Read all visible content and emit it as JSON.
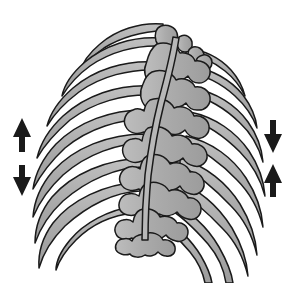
{
  "figure": {
    "title": "Rib cage and thoracic spine, posterior view",
    "view": "posterior",
    "style": "line-drawing",
    "background_color": "#ffffff"
  },
  "palette": {
    "bone_fill": "#ababab",
    "bone_fill_light": "#c4c4c4",
    "bone_fill_dark": "#9a9a9a",
    "outline": "#1a1a1a",
    "arrow_fill": "#1a1a1a",
    "background": "#ffffff"
  },
  "structures": {
    "spine": {
      "name": "thoracic-vertebral-column",
      "label": "Thoracic vertebral column",
      "vertebra_count": 9,
      "orientation": "vertical-center"
    },
    "ribs_left": {
      "name": "ribs-left-side",
      "label": "Left ribs",
      "count": 9
    },
    "ribs_right": {
      "name": "ribs-right-side",
      "label": "Right ribs",
      "count": 9
    }
  },
  "arrows": [
    {
      "id": "arrow-left-up",
      "label": "Upward movement (left, superior)",
      "direction": "up",
      "side": "left",
      "position": "superior",
      "x": 22,
      "y_top": 118,
      "y_bottom": 152
    },
    {
      "id": "arrow-left-down",
      "label": "Downward movement (left, inferior)",
      "direction": "down",
      "side": "left",
      "position": "inferior",
      "x": 22,
      "y_top": 165,
      "y_bottom": 196
    },
    {
      "id": "arrow-right-down",
      "label": "Downward movement (right, superior)",
      "direction": "down",
      "side": "right",
      "position": "superior",
      "x": 273,
      "y_top": 120,
      "y_bottom": 153
    },
    {
      "id": "arrow-right-up",
      "label": "Upward movement (right, inferior)",
      "direction": "up",
      "side": "right",
      "position": "inferior",
      "x": 273,
      "y_top": 164,
      "y_bottom": 197
    }
  ],
  "text": {
    "visible_labels": [],
    "note": ""
  }
}
